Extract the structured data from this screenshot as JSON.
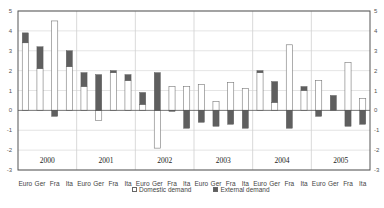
{
  "chart_data": {
    "type": "bar",
    "stacked": true,
    "title": "",
    "xlabel": "",
    "ylabel": "",
    "ylim": [
      -3,
      5
    ],
    "yticks": [
      5,
      4,
      3,
      2,
      1,
      0,
      -1,
      -2,
      -3
    ],
    "grid": true,
    "dual_y_axis": true,
    "legend_position": "bottom",
    "groups": [
      "2000",
      "2001",
      "2002",
      "2003",
      "2004",
      "2005"
    ],
    "categories": [
      "Euro",
      "Ger",
      "Fra",
      "Ita",
      "Euro",
      "Ger",
      "Fra",
      "Ita",
      "Euro",
      "Ger",
      "Fra",
      "Ita",
      "Euro",
      "Ger",
      "Fra",
      "Ita",
      "Euro",
      "Ger",
      "Fra",
      "Ita",
      "Euro",
      "Ger",
      "Fra",
      "Ita"
    ],
    "series": [
      {
        "name": "Domestic demand",
        "color": "#ffffff",
        "values": [
          3.4,
          2.1,
          4.5,
          2.2,
          1.2,
          -0.5,
          1.9,
          1.5,
          0.3,
          -1.9,
          1.2,
          1.2,
          1.3,
          0.45,
          1.4,
          1.1,
          1.9,
          0.4,
          3.3,
          1.0,
          1.5,
          0.0,
          2.4,
          0.6
        ]
      },
      {
        "name": "External demand",
        "color": "#5f5f5f",
        "values": [
          0.5,
          1.1,
          -0.3,
          0.8,
          0.7,
          1.8,
          0.1,
          0.3,
          0.6,
          1.9,
          -0.05,
          -0.9,
          -0.6,
          -0.8,
          -0.7,
          -0.9,
          0.1,
          1.05,
          -0.9,
          0.2,
          -0.3,
          0.75,
          -0.8,
          -0.7
        ]
      }
    ]
  },
  "legend": {
    "domestic_label": "Domestic demand",
    "external_label": "External demand"
  }
}
